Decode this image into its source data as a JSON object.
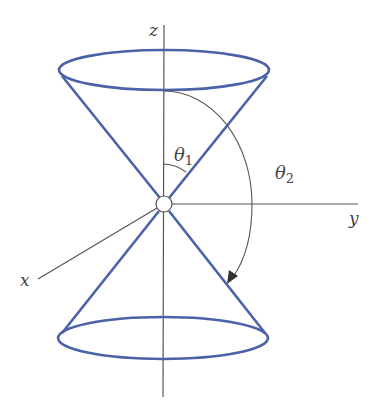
{
  "diagram": {
    "type": "double cone about z-axis in 3D coordinate system",
    "axes": {
      "z": "z",
      "y": "y",
      "x": "x"
    },
    "angles": {
      "theta1": {
        "symbol": "θ",
        "subscript": "1"
      },
      "theta2": {
        "symbol": "θ",
        "subscript": "2"
      }
    },
    "colors": {
      "cone": "#4a62a8",
      "axis": "#555555",
      "label": "#444444",
      "background": "#ffffff"
    }
  }
}
